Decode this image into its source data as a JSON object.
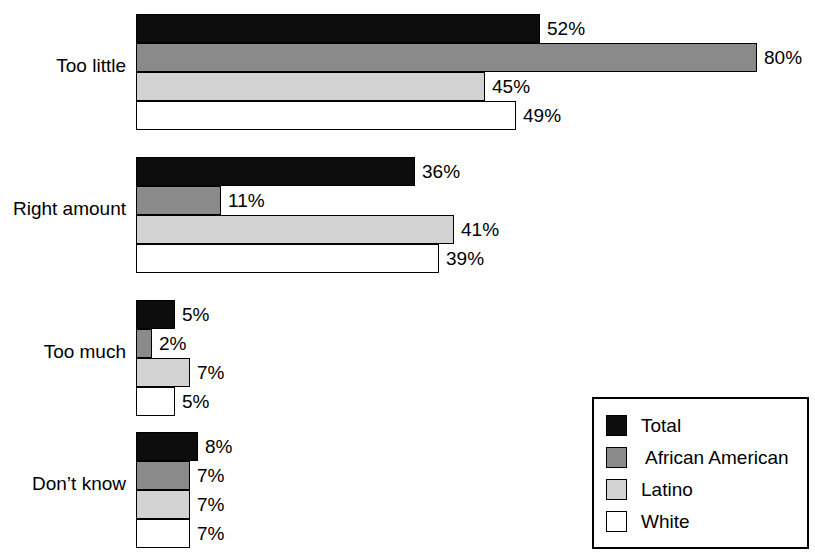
{
  "chart_data": {
    "type": "bar",
    "orientation": "horizontal",
    "title": "",
    "xlabel": "",
    "ylabel": "",
    "xlim": [
      0,
      100
    ],
    "grid": false,
    "legend_position": "bottom-right",
    "value_suffix": "%",
    "px_per_percent": 7.76,
    "categories": [
      "Too little",
      "Right amount",
      "Too much",
      "Don't know"
    ],
    "series": [
      {
        "name": "Total",
        "key": "total",
        "color": "#0d0d0d",
        "values": [
          52,
          36,
          5,
          8
        ]
      },
      {
        "name": "African American",
        "key": "african",
        "color": "#8a8a8a",
        "values": [
          80,
          11,
          2,
          7
        ]
      },
      {
        "name": "Latino",
        "key": "latino",
        "color": "#d2d2d2",
        "values": [
          45,
          41,
          7,
          7
        ]
      },
      {
        "name": "White",
        "key": "white",
        "color": "#ffffff",
        "values": [
          49,
          39,
          5,
          7
        ]
      }
    ],
    "value_labels": [
      [
        "52%",
        "80%",
        "45%",
        "49%"
      ],
      [
        "36%",
        "11%",
        "41%",
        "39%"
      ],
      [
        "5%",
        "2%",
        "7%",
        "5%"
      ],
      [
        "8%",
        "7%",
        "7%",
        "7%"
      ]
    ]
  },
  "groups": [
    {
      "label": "Too little",
      "top": 14,
      "label_top": 55,
      "bars": [
        {
          "series": "total",
          "value": 52,
          "value_label": "52%"
        },
        {
          "series": "african",
          "value": 80,
          "value_label": "80%"
        },
        {
          "series": "latino",
          "value": 45,
          "value_label": "45%"
        },
        {
          "series": "white",
          "value": 49,
          "value_label": "49%"
        }
      ]
    },
    {
      "label": "Right amount",
      "top": 157,
      "label_top": 198,
      "bars": [
        {
          "series": "total",
          "value": 36,
          "value_label": "36%"
        },
        {
          "series": "african",
          "value": 11,
          "value_label": "11%"
        },
        {
          "series": "latino",
          "value": 41,
          "value_label": "41%"
        },
        {
          "series": "white",
          "value": 39,
          "value_label": "39%"
        }
      ]
    },
    {
      "label": "Too much",
      "top": 300,
      "label_top": 341,
      "bars": [
        {
          "series": "total",
          "value": 5,
          "value_label": "5%"
        },
        {
          "series": "african",
          "value": 2,
          "value_label": "2%"
        },
        {
          "series": "latino",
          "value": 7,
          "value_label": "7%"
        },
        {
          "series": "white",
          "value": 5,
          "value_label": "5%"
        }
      ]
    },
    {
      "label": "Don’t know",
      "top": 432,
      "label_top": 473,
      "bars": [
        {
          "series": "total",
          "value": 8,
          "value_label": "8%"
        },
        {
          "series": "african",
          "value": 7,
          "value_label": "7%"
        },
        {
          "series": "latino",
          "value": 7,
          "value_label": "7%"
        },
        {
          "series": "white",
          "value": 7,
          "value_label": "7%"
        }
      ]
    }
  ],
  "legend": {
    "items": [
      {
        "label": "Total",
        "series": "total",
        "indented": false
      },
      {
        "label": "African American",
        "series": "african",
        "indented": true
      },
      {
        "label": "Latino",
        "series": "latino",
        "indented": false
      },
      {
        "label": "White",
        "series": "white",
        "indented": false
      }
    ]
  }
}
